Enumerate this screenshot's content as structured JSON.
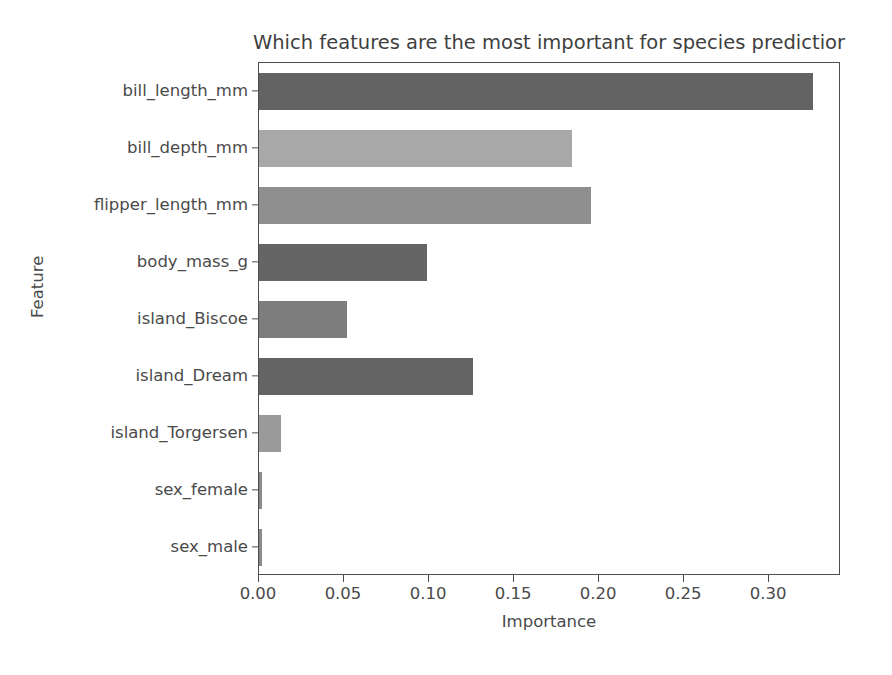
{
  "chart_data": {
    "type": "bar",
    "orientation": "horizontal",
    "title_visible_truncated": "Which features are the most important for species predictior",
    "xlabel": "Importance",
    "ylabel": "Feature",
    "categories": [
      "bill_length_mm",
      "bill_depth_mm",
      "flipper_length_mm",
      "body_mass_g",
      "island_Biscoe",
      "island_Dream",
      "island_Torgersen",
      "sex_female",
      "sex_male"
    ],
    "values": [
      0.326,
      0.184,
      0.195,
      0.099,
      0.052,
      0.126,
      0.013,
      0.002,
      0.002
    ],
    "bar_colors": [
      "#636363",
      "#a8a8a8",
      "#8f8f8f",
      "#656565",
      "#7d7d7d",
      "#646464",
      "#9a9a9a",
      "#8a8a8a",
      "#8a8a8a"
    ],
    "xlim": [
      0.0,
      0.3423
    ],
    "xticks": [
      0.0,
      0.05,
      0.1,
      0.15,
      0.2,
      0.25,
      0.3
    ],
    "xtick_labels": [
      "0.00",
      "0.05",
      "0.10",
      "0.15",
      "0.20",
      "0.25",
      "0.30"
    ],
    "grid": false,
    "legend": null,
    "axis_color": "#4d4d4d",
    "text_color": "#4a4a4a",
    "background": "#ffffff"
  }
}
